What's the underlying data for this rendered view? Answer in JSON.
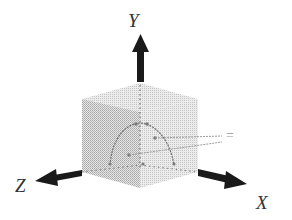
{
  "diagram": {
    "axes": {
      "y": {
        "label": "Y"
      },
      "z": {
        "label": "Z"
      },
      "x": {
        "label": "X"
      }
    },
    "annotation": {
      "label": "="
    },
    "colors": {
      "arrow": "#1a1a1a",
      "cube_fill": "#bdbdbd",
      "arc": "#7a7a7a",
      "label": "#333333",
      "leader": "#9a9a9a"
    }
  }
}
